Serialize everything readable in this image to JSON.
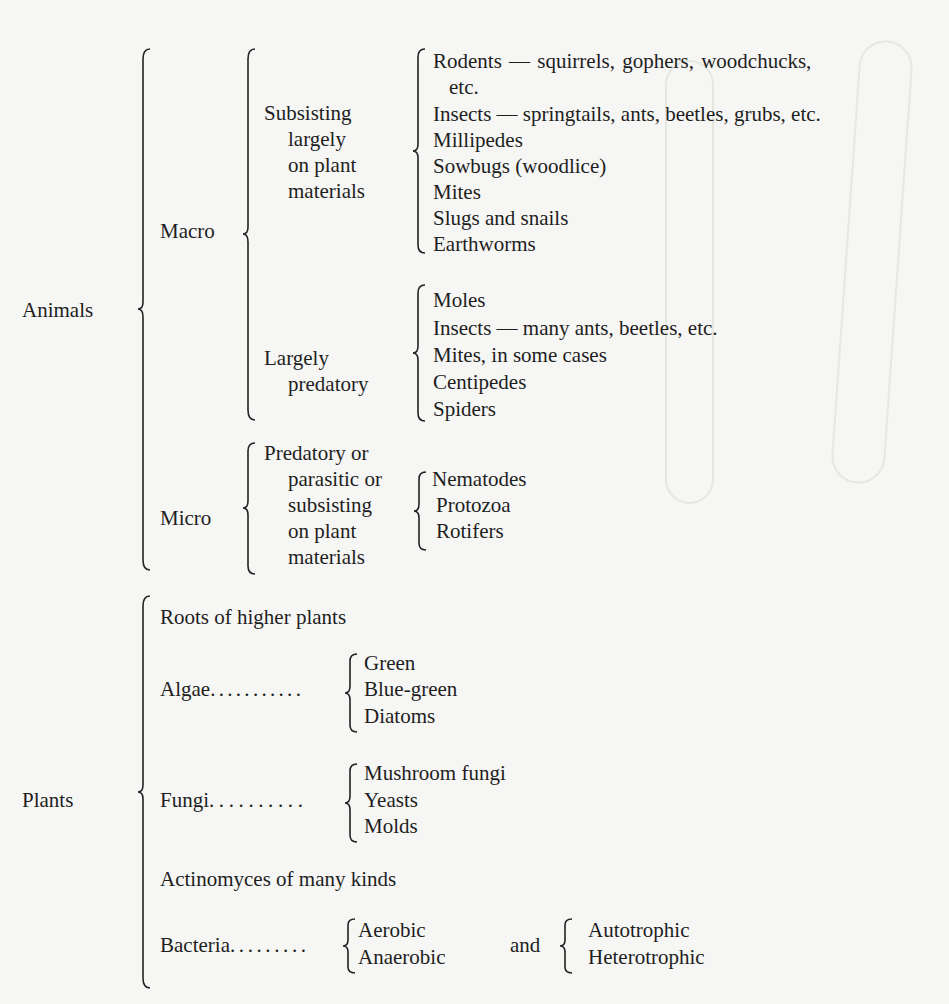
{
  "page": {
    "background": "#f6f6f4",
    "text_color": "#1e1e1e"
  },
  "classification": {
    "animals": {
      "label": "Animals",
      "macro": {
        "label": "Macro",
        "plant_feeders": {
          "label_lines": [
            "Subsisting",
            "largely",
            "on plant",
            "materials"
          ],
          "items": [
            "Rodents — squirrels,   gophers,   woodchucks,",
            "etc.",
            "Insects — springtails, ants, beetles, grubs, etc.",
            "Millipedes",
            "Sowbugs (woodlice)",
            "Mites",
            "Slugs and snails",
            "Earthworms"
          ]
        },
        "predators": {
          "label_lines": [
            "Largely",
            "predatory"
          ],
          "items": [
            "Moles",
            "Insects — many ants, beetles, etc.",
            "Mites, in some cases",
            "Centipedes",
            "Spiders"
          ]
        }
      },
      "micro": {
        "label": "Micro",
        "group_label_lines": [
          "Predatory or",
          "parasitic or",
          "subsisting",
          "on plant",
          "materials"
        ],
        "items": [
          "Nematodes",
          "Protozoa",
          "Rotifers"
        ]
      }
    },
    "plants": {
      "label": "Plants",
      "roots": "Roots of higher plants",
      "algae": {
        "label": "Algae",
        "leader": "...........",
        "items": [
          "Green",
          "Blue-green",
          "Diatoms"
        ]
      },
      "fungi": {
        "label": "Fungi",
        "leader": "..........",
        "items": [
          "Mushroom fungi",
          "Yeasts",
          "Molds"
        ]
      },
      "actinomyces": "Actinomyces of many kinds",
      "bacteria": {
        "label": "Bacteria",
        "leader": ".........",
        "oxygen": [
          "Aerobic",
          "Anaerobic"
        ],
        "connector": "and",
        "nutrition": [
          "Autotrophic",
          "Heterotrophic"
        ]
      }
    }
  }
}
